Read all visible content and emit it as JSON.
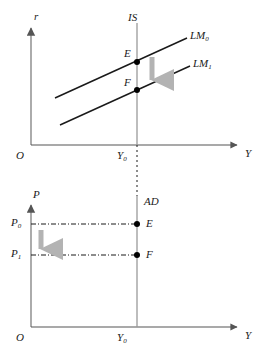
{
  "figure": {
    "type": "economics-diagram",
    "panels": [
      {
        "id": "is-lm",
        "axis_y_label": "r",
        "axis_x_label": "Y",
        "origin_label": "O",
        "x_tick_label": "Y",
        "x_tick_sub": "0",
        "curves": [
          {
            "name": "IS",
            "label": "IS",
            "orientation": "vertical"
          },
          {
            "name": "LM0",
            "label": "LM",
            "sub": "0",
            "orientation": "upward-sloping"
          },
          {
            "name": "LM1",
            "label": "LM",
            "sub": "1",
            "orientation": "upward-sloping"
          }
        ],
        "points": [
          {
            "label": "E",
            "on": "IS x LM0"
          },
          {
            "label": "F",
            "on": "IS x LM1"
          }
        ],
        "shift_arrow": {
          "direction": "down",
          "color": "#b3b3b3"
        }
      },
      {
        "id": "ad",
        "axis_y_label": "P",
        "axis_x_label": "Y",
        "origin_label": "O",
        "x_tick_label": "Y",
        "x_tick_sub": "0",
        "curves": [
          {
            "name": "AD",
            "label": "AD",
            "orientation": "vertical"
          }
        ],
        "y_ticks": [
          {
            "label": "P",
            "sub": "0"
          },
          {
            "label": "P",
            "sub": "1"
          }
        ],
        "points": [
          {
            "label": "E",
            "on": "AD at P0"
          },
          {
            "label": "F",
            "on": "AD at P1"
          }
        ],
        "shift_arrow": {
          "direction": "down",
          "color": "#b3b3b3"
        }
      }
    ],
    "colors": {
      "axis": "#888888",
      "curve": "#1a1a1a",
      "vertical_line": "#9a9a9a",
      "arrow": "#b3b3b3",
      "dashed": "#1a1a1a",
      "point": "#000000",
      "text": "#1a1a1a",
      "background": "#ffffff"
    }
  },
  "labels": {
    "panel1": {
      "r": "r",
      "IS": "IS",
      "LM0_base": "LM",
      "LM0_sub": "0",
      "LM1_base": "LM",
      "LM1_sub": "1",
      "E": "E",
      "F": "F",
      "O": "O",
      "Y0_base": "Y",
      "Y0_sub": "0",
      "Y": "Y"
    },
    "panel2": {
      "P": "P",
      "AD": "AD",
      "P0_base": "P",
      "P0_sub": "0",
      "P1_base": "P",
      "P1_sub": "1",
      "E": "E",
      "F": "F",
      "O": "O",
      "Y0_base": "Y",
      "Y0_sub": "0",
      "Y": "Y"
    }
  }
}
